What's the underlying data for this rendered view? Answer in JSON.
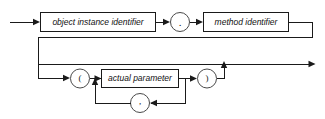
{
  "diagram": {
    "kind": "railroad-syntax-diagram",
    "colors": {
      "background": "#ffffff",
      "line": "#1a1a1a",
      "box_stroke": "#1a1a1a",
      "circle_stroke": "#4a4a4a",
      "text": "#111111"
    },
    "nonterminals": [
      {
        "id": "object-instance-identifier",
        "label": "object instance identifier"
      },
      {
        "id": "method-identifier",
        "label": "method identifier"
      },
      {
        "id": "actual-parameter",
        "label": "actual parameter"
      }
    ],
    "terminals": [
      {
        "id": "dot",
        "label": "."
      },
      {
        "id": "open-paren",
        "label": "("
      },
      {
        "id": "close-paren",
        "label": ")"
      },
      {
        "id": "comma",
        "label": ","
      }
    ]
  }
}
